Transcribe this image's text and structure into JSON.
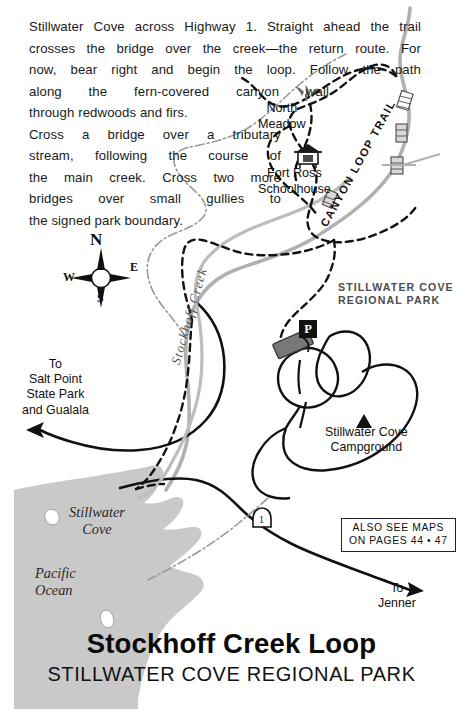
{
  "document": {
    "kind": "trail-guide-map-page",
    "page_width": 463,
    "page_height": 709
  },
  "intro_text": {
    "line1": "Stillwater Cove across Highway 1. Straight ahead the trail",
    "line2": "crosses the bridge over the creek—the return route. For",
    "line3": "now, bear right and begin the loop. Follow the path",
    "line4": "along the fern-covered canyon wall",
    "line5": "through redwoods and firs.",
    "line6": "Cross a bridge over a tributary",
    "line7": "stream, following the course of",
    "line8": "the main creek. Cross two more",
    "line9": "bridges over small gullies to",
    "line10": "the signed park boundary."
  },
  "map_labels": {
    "north_meadow_line1": "North",
    "north_meadow_line2": "Meadow",
    "fort_ross_line1": "Fort Ross",
    "fort_ross_line2": "Schoolhouse",
    "park_name_line1": "STILLWATER COVE",
    "park_name_line2": "REGIONAL PARK",
    "campground_line1": "Stillwater Cove",
    "campground_line2": "Campground",
    "canyon_loop_trail": "CANYON LOOP TRAIL",
    "stockhoff_creek": "Stockhoff Creek",
    "stillwater_cove_line1": "Stillwater",
    "stillwater_cove_line2": "Cove",
    "pacific_ocean_line1": "Pacific",
    "pacific_ocean_line2": "Ocean",
    "to_salt_point_line1": "To",
    "to_salt_point_line2": "Salt Point",
    "to_salt_point_line3": "State Park",
    "to_salt_point_line4": "and Gualala",
    "to_jenner_line1": "To",
    "to_jenner_line2": "Jenner",
    "parking_symbol": "P",
    "highway_shield_number": "1"
  },
  "see_maps_box": {
    "line1": "ALSO SEE MAPS",
    "line2": "ON PAGES 44 • 47"
  },
  "compass": {
    "north": "N",
    "east": "E",
    "south": "S",
    "west": "W"
  },
  "titles": {
    "main": "Stockhoff Creek Loop",
    "sub": "STILLWATER COVE REGIONAL PARK"
  },
  "colors": {
    "ocean_fill": "#c9c9c9",
    "road_gray": "#b0b0b0",
    "creek_gray": "#bdbdbd",
    "trail_black": "#111111",
    "park_label_gray": "#4c4c4c",
    "parking_lot_fill": "#787878",
    "paper": "#ffffff",
    "boundary_gray": "#9a9a9a"
  }
}
